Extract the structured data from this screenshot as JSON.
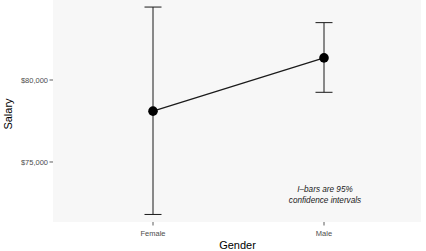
{
  "chart_data": {
    "type": "line",
    "title": "",
    "xlabel": "Gender",
    "ylabel": "Salary",
    "categories": [
      "Female",
      "Male"
    ],
    "series": [
      {
        "name": "Mean salary",
        "values": [
          78100,
          81350
        ],
        "ci_lower": [
          71800,
          79250
        ],
        "ci_upper": [
          84450,
          83500
        ]
      }
    ],
    "y_ticks": [
      75000,
      80000
    ],
    "y_tick_labels": [
      "$75,000",
      "$80,000"
    ],
    "ylim": [
      71340,
      84880
    ],
    "grid": false,
    "legend": null,
    "annotation": {
      "line1": "I–bars are 95%",
      "line2": "confidence intervals",
      "x_category_position": "Male",
      "y_value": 72950
    },
    "colors": {
      "panel_background": "#f7f7f7",
      "line": "#1a1a1a",
      "point": "#000000",
      "tick_label": "#4d4d4d"
    }
  }
}
